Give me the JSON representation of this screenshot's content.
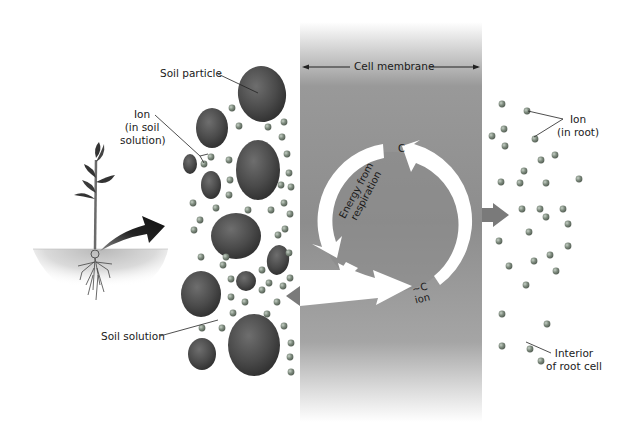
{
  "labels": {
    "soil_particle": "Soil particle",
    "ion_soil_line1": "Ion",
    "ion_soil_line2": "(in soil",
    "ion_soil_line3": "solution)",
    "soil_solution": "Soil solution",
    "cell_membrane": "Cell membrane",
    "ion_root_line1": "Ion",
    "ion_root_line2": "(in root)",
    "interior_line1": "Interior",
    "interior_line2": "of root cell",
    "carrier": "C",
    "carrier_ion_line1": "~C",
    "carrier_ion_line2": "ion",
    "energy_line1": "Energy from",
    "energy_line2": "respiration"
  },
  "colors": {
    "membrane": "#8f8f8f",
    "soil_particle": "#4a4a4a",
    "ion": "#7d8a7d",
    "arrow_white": "#ffffff",
    "arrow_dark": "#222222",
    "label_text": "#1a1a1a"
  }
}
